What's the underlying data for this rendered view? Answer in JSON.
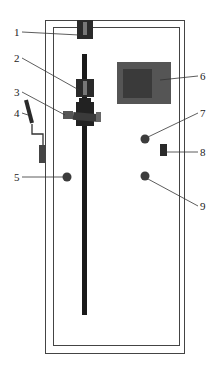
{
  "diagram": {
    "type": "apparatus-schematic",
    "callouts": [
      {
        "id": "1",
        "label": "1",
        "x": 14,
        "y": 27,
        "target": "top-mount-block"
      },
      {
        "id": "2",
        "label": "2",
        "x": 14,
        "y": 53,
        "target": "upper-clamp-block"
      },
      {
        "id": "3",
        "label": "3",
        "x": 14,
        "y": 87,
        "target": "side-knob-assembly"
      },
      {
        "id": "4",
        "label": "4",
        "x": 14,
        "y": 108,
        "target": "lever-handle"
      },
      {
        "id": "5",
        "label": "5",
        "x": 14,
        "y": 172,
        "target": "left-round-button"
      },
      {
        "id": "6",
        "label": "6",
        "x": 200,
        "y": 71,
        "target": "display-screen"
      },
      {
        "id": "7",
        "label": "7",
        "x": 200,
        "y": 108,
        "target": "upper-right-round-button"
      },
      {
        "id": "8",
        "label": "8",
        "x": 200,
        "y": 147,
        "target": "switch"
      },
      {
        "id": "9",
        "label": "9",
        "x": 200,
        "y": 201,
        "target": "lower-right-round-button"
      }
    ],
    "colors": {
      "frame": "#444444",
      "rod": "#1a1a1a",
      "screen_outer": "#555555",
      "screen_inner": "#3a3a3a",
      "button": "#3c3c3c"
    }
  }
}
